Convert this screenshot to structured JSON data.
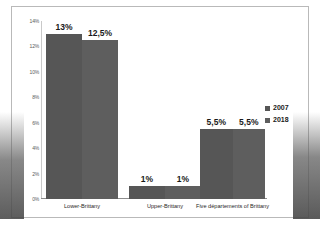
{
  "chart_data": {
    "type": "bar",
    "title": "",
    "xlabel": "",
    "ylabel": "",
    "ylim": [
      0,
      14
    ],
    "grid": false,
    "legend_position": "right",
    "categories": [
      "Lower-Brittany",
      "Upper-Brittany",
      "Five départements of Brittany"
    ],
    "ytick_labels": [
      "14%",
      "12%",
      "10%",
      "8%",
      "6%",
      "4%",
      "2%",
      "0%"
    ],
    "ytick_values": [
      14,
      12,
      10,
      8,
      6,
      4,
      2,
      0
    ],
    "series": [
      {
        "name": "2007",
        "color": "#565656",
        "values": [
          13,
          1,
          5.5
        ],
        "data_labels": [
          "13%",
          "1%",
          "5,5%"
        ]
      },
      {
        "name": "2018",
        "color": "#5e5e5e",
        "values": [
          12.5,
          1,
          5.5
        ],
        "data_labels": [
          "12,5%",
          "1%",
          "5,5%"
        ]
      }
    ]
  },
  "legend": {
    "items": [
      {
        "label": "2007",
        "color": "#565656"
      },
      {
        "label": "2018",
        "color": "#5e5e5e"
      }
    ]
  }
}
